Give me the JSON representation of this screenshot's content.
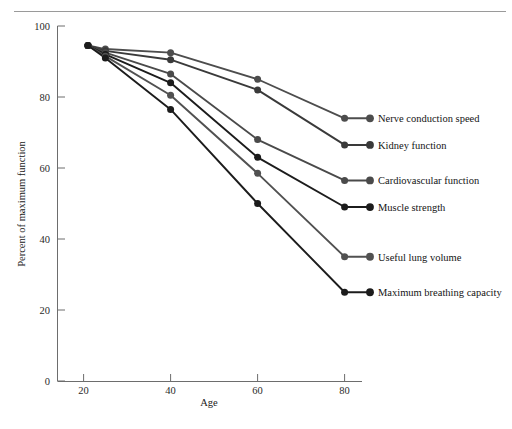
{
  "chart_data": {
    "type": "line",
    "title": "",
    "subtitle": "",
    "xlabel": "Age",
    "ylabel": "Percent of maximum function",
    "xlim": [
      14,
      84
    ],
    "ylim": [
      0,
      100
    ],
    "xticks": [
      20,
      40,
      60,
      80
    ],
    "yticks": [
      0,
      20,
      40,
      60,
      80,
      100
    ],
    "xtick_labels": [
      "20",
      "40",
      "60",
      "80"
    ],
    "ytick_labels": [
      "0",
      "20",
      "40",
      "60",
      "80",
      "100"
    ],
    "grid": false,
    "legend_position": "right-inline-labels",
    "x": [
      21,
      25,
      40,
      60,
      80
    ],
    "series": [
      {
        "name": "Nerve conduction speed",
        "values": [
          94.5,
          93.5,
          92.5,
          85.0,
          74.0
        ],
        "color": "#4d4d4d",
        "label_value": 74.0
      },
      {
        "name": "Kidney function",
        "values": [
          94.5,
          93.0,
          90.5,
          82.0,
          66.5
        ],
        "color": "#3a3a3a",
        "label_value": 66.5
      },
      {
        "name": "Cardiovascular function",
        "values": [
          94.5,
          92.5,
          86.5,
          68.0,
          56.5
        ],
        "color": "#4a4a4a",
        "label_value": 56.5
      },
      {
        "name": "Muscle strength",
        "values": [
          94.5,
          92.0,
          84.0,
          63.0,
          49.0
        ],
        "color": "#1c1c1c",
        "label_value": 49.0
      },
      {
        "name": "Useful lung volume",
        "values": [
          94.5,
          91.5,
          80.5,
          58.5,
          35.0
        ],
        "color": "#515151",
        "label_value": 35.0
      },
      {
        "name": "Maximum breathing capacity",
        "values": [
          94.5,
          91.0,
          76.5,
          50.0,
          25.0
        ],
        "color": "#1c1c1c",
        "label_value": 25.0
      }
    ]
  },
  "axes": {
    "x_title": "Age",
    "y_title": "Percent of maximum function"
  },
  "labels": {
    "items": [
      "Nerve conduction speed",
      "Kidney function",
      "Cardiovascular function",
      "Muscle strength",
      "Useful lung volume",
      "Maximum breathing capacity"
    ]
  }
}
